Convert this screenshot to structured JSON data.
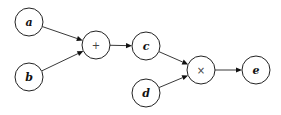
{
  "diagram": {
    "type": "computational-graph",
    "nodes": [
      {
        "id": "a",
        "label": "a",
        "kind": "variable"
      },
      {
        "id": "b",
        "label": "b",
        "kind": "variable"
      },
      {
        "id": "plus",
        "label": "+",
        "kind": "operator"
      },
      {
        "id": "c",
        "label": "c",
        "kind": "variable"
      },
      {
        "id": "d",
        "label": "d",
        "kind": "variable"
      },
      {
        "id": "times",
        "label": "×",
        "kind": "operator"
      },
      {
        "id": "e",
        "label": "e",
        "kind": "variable"
      }
    ],
    "edges": [
      {
        "from": "a",
        "to": "plus"
      },
      {
        "from": "b",
        "to": "plus"
      },
      {
        "from": "plus",
        "to": "c"
      },
      {
        "from": "c",
        "to": "times"
      },
      {
        "from": "d",
        "to": "times"
      },
      {
        "from": "times",
        "to": "e"
      }
    ],
    "colors": {
      "stroke": "#222222",
      "text": "#111111",
      "background": "#ffffff"
    }
  }
}
